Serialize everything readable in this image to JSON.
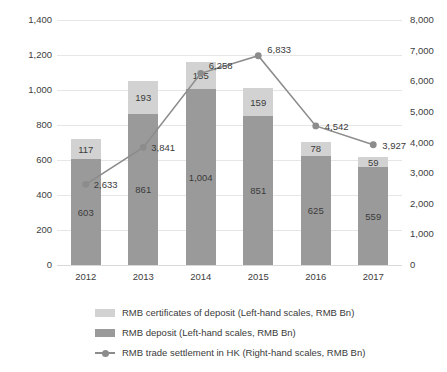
{
  "chart_data": {
    "type": "bar",
    "title": "",
    "subtitle": "",
    "xlabel": "",
    "ylabel": "",
    "categories": [
      "2012",
      "2013",
      "2014",
      "2015",
      "2016",
      "2017"
    ],
    "grid": true,
    "legend_position": "bottom-left",
    "left_axis": {
      "label": "Left-hand scales, RMB Bn",
      "ylim": [
        0,
        1400
      ],
      "tick_step": 200,
      "ticks": [
        "0",
        "200",
        "400",
        "600",
        "800",
        "1,000",
        "1,200",
        "1,400"
      ],
      "tick_values": [
        0,
        200,
        400,
        600,
        800,
        1000,
        1200,
        1400
      ]
    },
    "right_axis": {
      "label": "Right-hand scales, RMB Bn",
      "ylim": [
        0,
        8000
      ],
      "tick_step": 1000,
      "ticks": [
        "0",
        "1,000",
        "2,000",
        "3,000",
        "4,000",
        "5,000",
        "6,000",
        "7,000",
        "8,000"
      ],
      "tick_values": [
        0,
        1000,
        2000,
        3000,
        4000,
        5000,
        6000,
        7000,
        8000
      ]
    },
    "series": [
      {
        "name": "RMB deposit (Left-hand scales, RMB Bn)",
        "type": "bar",
        "stack": "totals",
        "axis": "left",
        "color": "#9a9a9a",
        "values": [
          603,
          861,
          1004,
          851,
          625,
          559
        ],
        "labels": [
          "603",
          "861",
          "1,004",
          "851",
          "625",
          "559"
        ]
      },
      {
        "name": "RMB certificates of deposit (Left-hand scales, RMB Bn)",
        "type": "bar",
        "stack": "totals",
        "axis": "left",
        "color": "#d2d2d2",
        "values": [
          117,
          193,
          155,
          159,
          78,
          59
        ],
        "labels": [
          "117",
          "193",
          "155",
          "159",
          "78",
          "59"
        ]
      },
      {
        "name": "RMB trade settlement in HK (Right-hand scales, RMB Bn)",
        "type": "line",
        "axis": "right",
        "color": "#8c8c8c",
        "values": [
          2633,
          3841,
          6258,
          6833,
          4542,
          3927
        ],
        "labels": [
          "2,633",
          "3,841",
          "6,258",
          "6,833",
          "4,542",
          "3,927"
        ]
      }
    ]
  },
  "legend": {
    "items": [
      {
        "label": "RMB certificates of deposit (Left-hand scales, RMB Bn)",
        "color": "#d2d2d2",
        "marker": "square"
      },
      {
        "label": "RMB deposit (Left-hand scales, RMB Bn)",
        "color": "#9a9a9a",
        "marker": "square"
      },
      {
        "label": "RMB trade settlement in HK (Right-hand scales, RMB Bn)",
        "color": "#8c8c8c",
        "marker": "line-point"
      }
    ]
  }
}
